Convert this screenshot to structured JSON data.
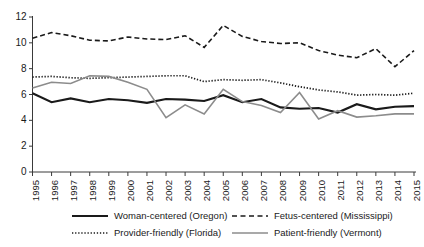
{
  "chart_data": {
    "type": "line",
    "title": "",
    "subtitle": "",
    "xlabel": "",
    "ylabel": "",
    "xlim": [
      1995,
      2015
    ],
    "ylim": [
      0,
      12
    ],
    "yticks": [
      0,
      2,
      4,
      6,
      8,
      10,
      12
    ],
    "grid": false,
    "legend_position": "bottom",
    "x": [
      1995,
      1996,
      1997,
      1998,
      1999,
      2000,
      2001,
      2002,
      2003,
      2004,
      2005,
      2006,
      2007,
      2008,
      2009,
      2010,
      2011,
      2012,
      2013,
      2014,
      2015
    ],
    "categories": [
      "1995",
      "1996",
      "1997",
      "1998",
      "1999",
      "2000",
      "2001",
      "2002",
      "2003",
      "2004",
      "2005",
      "2006",
      "2007",
      "2008",
      "2009",
      "2010",
      "2011",
      "2012",
      "2013",
      "2014",
      "2015"
    ],
    "series": [
      {
        "name": "Woman-centered (Oregon)",
        "style": "solid",
        "color": "#1a1a1a",
        "width": 2.1,
        "values": [
          6.1,
          5.4,
          5.7,
          5.4,
          5.65,
          5.55,
          5.35,
          5.65,
          5.6,
          5.5,
          5.95,
          5.4,
          5.65,
          5.0,
          4.9,
          4.95,
          4.6,
          5.25,
          4.85,
          5.05,
          5.1
        ]
      },
      {
        "name": "Fetus-centered (Mississippi)",
        "style": "dashed",
        "color": "#1a1a1a",
        "width": 1.6,
        "values": [
          10.35,
          10.8,
          10.55,
          10.2,
          10.15,
          10.45,
          10.3,
          10.25,
          10.55,
          9.65,
          11.35,
          10.5,
          10.1,
          9.95,
          10.0,
          9.4,
          9.05,
          8.85,
          9.55,
          8.15,
          9.4
        ]
      },
      {
        "name": "Provider-friendly (Florida)",
        "style": "dotted",
        "color": "#1a1a1a",
        "width": 1.7,
        "values": [
          7.35,
          7.4,
          7.3,
          7.25,
          7.3,
          7.35,
          7.4,
          7.45,
          7.45,
          7.0,
          7.15,
          7.1,
          7.15,
          6.9,
          6.6,
          6.35,
          6.2,
          5.95,
          6.0,
          5.95,
          6.1
        ]
      },
      {
        "name": "Patient-friendly (Vermont)",
        "style": "solid",
        "color": "#8c8c8c",
        "width": 1.6,
        "values": [
          6.5,
          6.95,
          6.85,
          7.45,
          7.4,
          6.95,
          6.4,
          4.2,
          5.2,
          4.5,
          6.4,
          5.45,
          5.15,
          4.6,
          6.15,
          4.1,
          4.75,
          4.25,
          4.35,
          4.5,
          4.5
        ]
      }
    ],
    "legend": [
      {
        "label": "Woman-centered (Oregon)",
        "style": "solid",
        "color": "#1a1a1a",
        "width": 2.1
      },
      {
        "label": "Fetus-centered (Mississippi)",
        "style": "dashed",
        "color": "#1a1a1a",
        "width": 1.6
      },
      {
        "label": "Provider-friendly (Florida)",
        "style": "dotted",
        "color": "#1a1a1a",
        "width": 1.7
      },
      {
        "label": "Patient-friendly (Vermont)",
        "style": "solid",
        "color": "#8c8c8c",
        "width": 1.6
      }
    ]
  }
}
